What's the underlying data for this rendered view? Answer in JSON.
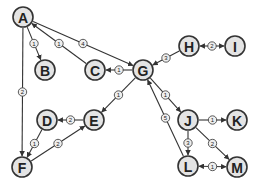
{
  "graph": {
    "type": "weighted-directed-graph",
    "nodes": [
      {
        "id": "A",
        "x": 23,
        "y": 17
      },
      {
        "id": "B",
        "x": 45,
        "y": 70
      },
      {
        "id": "C",
        "x": 95,
        "y": 70
      },
      {
        "id": "G",
        "x": 143,
        "y": 70
      },
      {
        "id": "H",
        "x": 189,
        "y": 46
      },
      {
        "id": "I",
        "x": 235,
        "y": 46
      },
      {
        "id": "D",
        "x": 47,
        "y": 120
      },
      {
        "id": "E",
        "x": 94,
        "y": 120
      },
      {
        "id": "F",
        "x": 22,
        "y": 167
      },
      {
        "id": "J",
        "x": 188,
        "y": 120
      },
      {
        "id": "K",
        "x": 237,
        "y": 120
      },
      {
        "id": "L",
        "x": 188,
        "y": 166
      },
      {
        "id": "M",
        "x": 237,
        "y": 167
      }
    ],
    "edges": [
      {
        "from": "A",
        "to": "B",
        "weight": "1",
        "dir": "forward"
      },
      {
        "from": "C",
        "to": "A",
        "weight": "1",
        "dir": "forward"
      },
      {
        "from": "A",
        "to": "G",
        "weight": "4",
        "dir": "forward"
      },
      {
        "from": "G",
        "to": "C",
        "weight": "1",
        "dir": "forward"
      },
      {
        "from": "H",
        "to": "G",
        "weight": "3",
        "dir": "forward"
      },
      {
        "from": "H",
        "to": "I",
        "weight": "2",
        "dir": "both"
      },
      {
        "from": "A",
        "to": "F",
        "weight": "2",
        "dir": "forward"
      },
      {
        "from": "G",
        "to": "E",
        "weight": "1",
        "dir": "forward"
      },
      {
        "from": "E",
        "to": "D",
        "weight": "2",
        "dir": "forward"
      },
      {
        "from": "D",
        "to": "F",
        "weight": "1",
        "dir": "forward"
      },
      {
        "from": "F",
        "to": "E",
        "weight": "2",
        "dir": "forward"
      },
      {
        "from": "G",
        "to": "J",
        "weight": "1",
        "dir": "forward"
      },
      {
        "from": "L",
        "to": "G",
        "weight": "5",
        "dir": "forward"
      },
      {
        "from": "J",
        "to": "K",
        "weight": "1",
        "dir": "forward"
      },
      {
        "from": "J",
        "to": "L",
        "weight": "3",
        "dir": "forward"
      },
      {
        "from": "J",
        "to": "M",
        "weight": "2",
        "dir": "forward"
      },
      {
        "from": "L",
        "to": "M",
        "weight": "1",
        "dir": "both"
      }
    ]
  }
}
